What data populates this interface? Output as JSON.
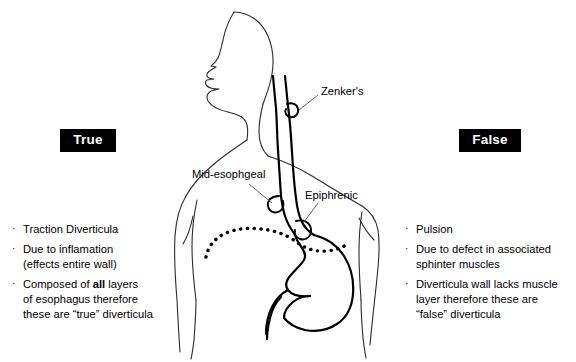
{
  "figure": {
    "background_color": "#ffffff",
    "ink_color": "#000000",
    "body_outline_color": "#2b2b2b"
  },
  "columns": {
    "left": {
      "verdict_label": "True",
      "verdict_bg": "#000000",
      "verdict_fg": "#ffffff",
      "bullet_mark": "·",
      "bullets": [
        {
          "html": "Traction Diverticula",
          "text": "Traction Diverticula"
        },
        {
          "html": "Due to inflamation\n(effects entire wall)",
          "text": "Due to inflamation (effects entire wall)"
        },
        {
          "html": "Composed of <b>all</b> layers\nof esophagus therefore\nthese are “true” diverticula",
          "text": "Composed of all layers of esophagus therefore these are “true” diverticula"
        }
      ]
    },
    "right": {
      "verdict_label": "False",
      "verdict_bg": "#000000",
      "verdict_fg": "#ffffff",
      "bullet_mark": "·",
      "bullets": [
        {
          "html": "Pulsion",
          "text": "Pulsion"
        },
        {
          "html": "Due to defect in associated\nsphinter muscles",
          "text": "Due to defect in associated sphinter muscles"
        },
        {
          "html": "Diverticula wall lacks muscle\nlayer therefore these are\n“false” diverticula",
          "text": "Diverticula wall lacks muscle layer therefore these are “false” diverticula"
        }
      ]
    }
  },
  "anatomy_labels": {
    "zenkers": "Zenker's",
    "mid_esophageal": "Mid-esophgeal",
    "epiphrenic": "Epiphrenic"
  },
  "anatomy_parts": [
    "head-profile",
    "neck",
    "shoulders",
    "arms",
    "torso",
    "esophagus",
    "stomach",
    "duodenum",
    "diaphragm-dotted",
    "zenkers-diverticulum-pouch",
    "mid-esophageal-diverticulum-pouch",
    "epiphrenic-diverticulum-pouch"
  ]
}
